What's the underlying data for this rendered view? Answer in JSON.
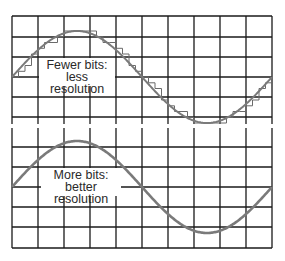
{
  "panels": [
    {
      "id": "fewer-bits",
      "label_line1": "Fewer bits:",
      "label_line2": "less resolution",
      "grid": {
        "x0": 12,
        "x1": 272,
        "cols": 10,
        "y_lines": [
          16,
          37,
          57,
          77,
          97,
          117
        ],
        "y_top": 16,
        "y_bottom": 124
      },
      "wave": {
        "center_y": 77,
        "amplitude": 46,
        "x_start": 12,
        "x_end": 272,
        "quantized": true,
        "levels": 16,
        "step_px": 6.5
      },
      "label_box": {
        "left": 39,
        "top": 58,
        "width": 76,
        "height": 27
      }
    },
    {
      "id": "more-bits",
      "label_line1": "More bits:",
      "label_line2": "better resolution",
      "grid": {
        "x0": 12,
        "x1": 272,
        "cols": 10,
        "y_lines": [
          147,
          167,
          187,
          207,
          227,
          248
        ],
        "y_top": 128,
        "y_bottom": 248
      },
      "wave": {
        "center_y": 187,
        "amplitude": 46,
        "x_start": 12,
        "x_end": 272,
        "quantized": false
      },
      "label_box": {
        "left": 41,
        "top": 168,
        "width": 80,
        "height": 27
      }
    }
  ],
  "colors": {
    "grid": "#1a1a1a",
    "wave": "#7a7a7a",
    "steps": "#6a6a6a",
    "text": "#2a2a2a"
  }
}
